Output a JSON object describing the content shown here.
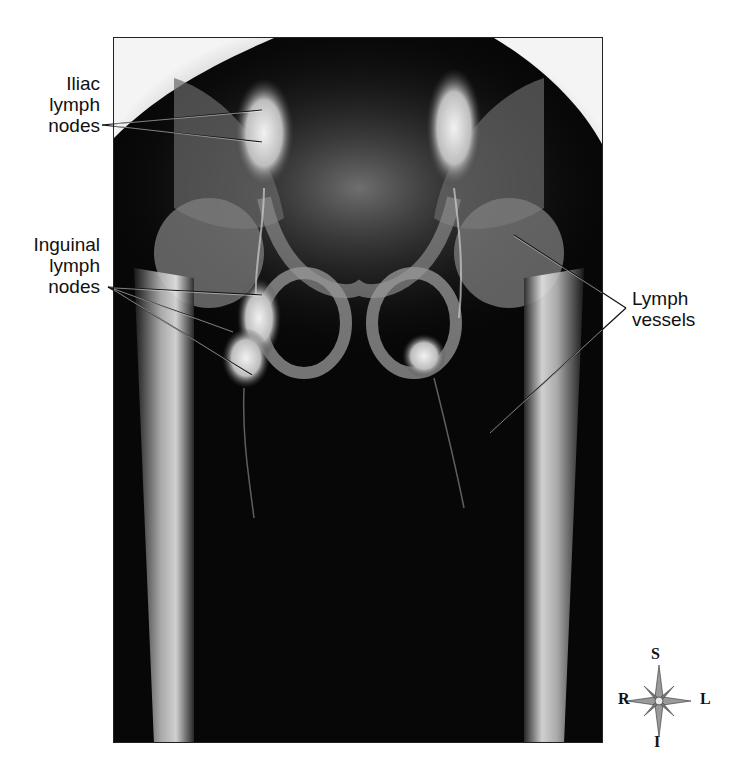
{
  "figure": {
    "labels": {
      "iliac": [
        "Iliac",
        "lymph",
        "nodes"
      ],
      "inguinal": [
        "Inguinal",
        "lymph",
        "nodes"
      ],
      "vessels": [
        "Lymph",
        "vessels"
      ]
    },
    "compass": {
      "top": "S",
      "bottom": "I",
      "left": "R",
      "right": "L",
      "icon": "compass-rose-icon"
    }
  }
}
